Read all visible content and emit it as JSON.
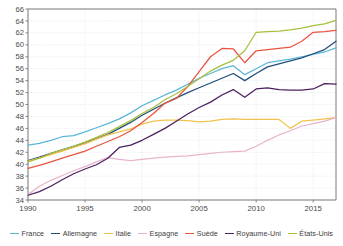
{
  "chart_data": {
    "type": "line",
    "title": "",
    "subtitle": "",
    "xlabel": "",
    "ylabel": "",
    "xlim": [
      1990,
      2017
    ],
    "ylim": [
      34,
      66
    ],
    "yticks": [
      34,
      36,
      38,
      40,
      42,
      44,
      46,
      48,
      50,
      52,
      54,
      56,
      58,
      60,
      62,
      64,
      66
    ],
    "xticks": [
      1990,
      1995,
      2000,
      2005,
      2010,
      2015
    ],
    "grid": true,
    "legend_position": "bottom",
    "x": [
      1990,
      1991,
      1992,
      1993,
      1994,
      1995,
      1996,
      1997,
      1998,
      1999,
      2000,
      2001,
      2002,
      2003,
      2004,
      2005,
      2006,
      2007,
      2008,
      2009,
      2010,
      2011,
      2012,
      2013,
      2014,
      2015,
      2016,
      2017
    ],
    "series": [
      {
        "name": "France",
        "color": "#5BB6D6",
        "values": [
          43.2,
          43.5,
          44.0,
          44.6,
          44.8,
          45.4,
          46.1,
          46.8,
          47.6,
          48.6,
          49.8,
          50.7,
          51.6,
          52.4,
          53.4,
          54.4,
          55.2,
          56.0,
          56.5,
          55.0,
          56.0,
          57.0,
          57.3,
          57.6,
          58.0,
          58.4,
          58.8,
          59.5
        ]
      },
      {
        "name": "Allemagne",
        "color": "#1F4E79",
        "values": [
          40.6,
          41.2,
          41.8,
          42.4,
          43.0,
          43.6,
          44.3,
          45.0,
          46.0,
          47.0,
          48.2,
          49.2,
          50.2,
          51.1,
          52.0,
          52.8,
          53.6,
          54.4,
          55.2,
          54.0,
          55.2,
          56.3,
          56.8,
          57.3,
          57.8,
          58.5,
          59.2,
          60.6
        ]
      },
      {
        "name": "Italie",
        "color": "#F2C14E",
        "values": [
          40.5,
          41.0,
          41.6,
          42.2,
          42.8,
          43.4,
          44.2,
          44.9,
          45.4,
          45.9,
          46.7,
          47.2,
          47.4,
          47.4,
          47.3,
          47.1,
          47.2,
          47.5,
          47.6,
          47.5,
          47.5,
          47.5,
          47.5,
          46.0,
          47.2,
          47.4,
          47.6,
          47.8
        ]
      },
      {
        "name": "Espagne",
        "color": "#E8B4CC",
        "values": [
          34.9,
          36.3,
          37.3,
          38.1,
          38.9,
          39.6,
          40.4,
          41.1,
          40.8,
          40.6,
          40.8,
          41.0,
          41.2,
          41.3,
          41.4,
          41.6,
          41.8,
          42.0,
          42.1,
          42.2,
          43.0,
          44.0,
          44.9,
          45.6,
          46.4,
          46.8,
          47.2,
          47.8
        ]
      },
      {
        "name": "Suède",
        "color": "#E8543F",
        "values": [
          39.3,
          39.8,
          40.4,
          41.0,
          41.6,
          42.2,
          43.0,
          43.8,
          44.6,
          45.6,
          47.0,
          48.5,
          50.2,
          51.0,
          53.0,
          55.5,
          58.0,
          59.4,
          59.3,
          57.0,
          59.0,
          59.2,
          59.4,
          59.6,
          60.6,
          62.1,
          62.2,
          62.4
        ]
      },
      {
        "name": "Royaume-Uni",
        "color": "#4B2060",
        "values": [
          34.8,
          35.4,
          36.3,
          37.4,
          38.4,
          39.2,
          39.9,
          41.0,
          42.8,
          43.2,
          44.0,
          45.0,
          46.0,
          47.2,
          48.4,
          49.5,
          50.4,
          51.6,
          52.5,
          51.2,
          52.6,
          52.8,
          52.5,
          52.4,
          52.4,
          52.6,
          53.5,
          53.4
        ]
      },
      {
        "name": "États-Unis",
        "color": "#A8BF3E",
        "values": [
          40.4,
          41.0,
          41.8,
          42.4,
          43.0,
          43.7,
          44.5,
          45.3,
          46.3,
          47.3,
          48.5,
          49.5,
          50.8,
          51.8,
          53.0,
          54.3,
          55.6,
          56.6,
          57.4,
          59.0,
          62.1,
          62.2,
          62.3,
          62.5,
          62.8,
          63.2,
          63.5,
          64.1
        ]
      }
    ]
  },
  "legend": {
    "items": [
      {
        "label": "France"
      },
      {
        "label": "Allemagne"
      },
      {
        "label": "Italie"
      },
      {
        "label": "Espagne"
      },
      {
        "label": "Suède"
      },
      {
        "label": "Royaume-Uni"
      },
      {
        "label": "États-Unis"
      }
    ]
  },
  "axes": {
    "y_tick_labels": [
      "66",
      "64",
      "62",
      "60",
      "58",
      "56",
      "54",
      "52",
      "50",
      "48",
      "46",
      "44",
      "42",
      "40",
      "38",
      "36",
      "34"
    ],
    "x_tick_labels": [
      "1990",
      "1995",
      "2000",
      "2005",
      "2010",
      "2015"
    ]
  },
  "colors": {
    "axis": "#7a7a7a",
    "grid": "#d8d8e4",
    "tick_text": "#4a4a4a",
    "background": "#ffffff"
  }
}
